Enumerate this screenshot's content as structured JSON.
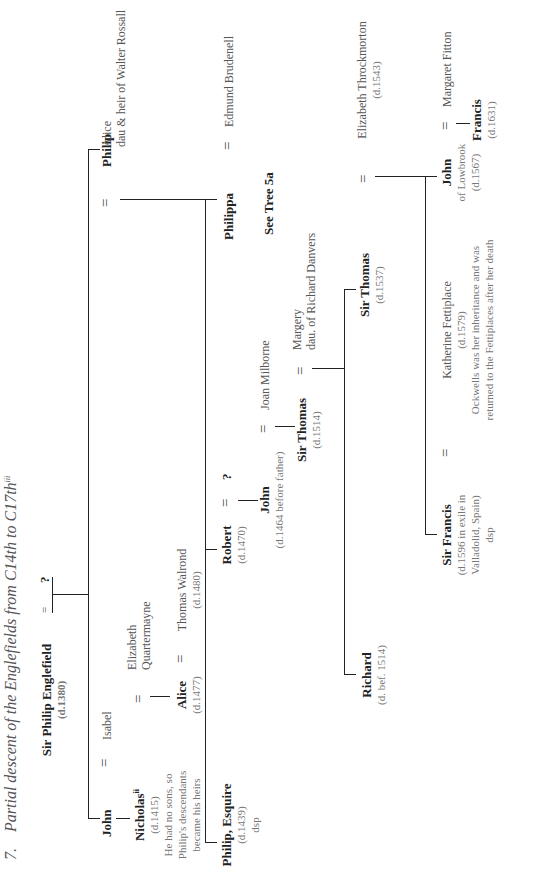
{
  "title": {
    "number": "7.",
    "text": "Partial descent of the Englefields from C14th to C17th",
    "note": "iii"
  },
  "people": {
    "sir_philip": {
      "name": "Sir Philip Englefield",
      "dates": "(d.1380)",
      "spouse": "?"
    },
    "john": {
      "name": "John",
      "spouse": "Isabel"
    },
    "nicholas": {
      "name": "Nicholas",
      "sup": "ii",
      "dates": "(d.1415)",
      "note1": "He had no sons, so",
      "note2": "Philip's descendants",
      "note3": "became his heirs",
      "spouse1": "Elizabeth",
      "spouse2": "Quartermayne"
    },
    "alice": {
      "name": "Alice",
      "dates": "(d.1477)",
      "spouse": "Thomas Walrond",
      "spouse_dates": "(d.1480)"
    },
    "philip": {
      "name": "Philip",
      "spouse": "Alice",
      "spouse_note": "dau & heir of Walter Rossall"
    },
    "philip_esq": {
      "name": "Philip, Esquire",
      "dates": "(d.1439)",
      "note": "dsp"
    },
    "robert": {
      "name": "Robert",
      "dates": "(d.1470)",
      "spouse": "?"
    },
    "john2": {
      "name": "John",
      "dates": "(d.1464 before father)",
      "spouse": "Joan Milborne"
    },
    "philippa": {
      "name": "Philippa",
      "spouse": "Edmund Brudenell",
      "note": "See Tree 5a"
    },
    "sir_thomas1": {
      "name": "Sir Thomas",
      "dates": "(d.1514)",
      "spouse1": "Margery",
      "spouse2": "dau. of Richard Danvers"
    },
    "richard": {
      "name": "Richard",
      "dates": "(d. bef. 1514)"
    },
    "sir_thomas2": {
      "name": "Sir Thomas",
      "dates": "(d.1537)",
      "spouse": "Elizabeth Throckmorton",
      "spouse_dates": "(d.1543)"
    },
    "sir_francis": {
      "name": "Sir Francis",
      "d1": "(d.1596 in exile in",
      "d2": "Valladolid, Spain)",
      "note": "dsp",
      "spouse": "Katherine Fettiplace",
      "spouse_dates": "(d.1579)",
      "n1": "Ockwells was her inheritance and was",
      "n2": "returned to the Fettiplaces after her death"
    },
    "john3": {
      "name": "John",
      "of": "of Lowbrook",
      "dates": "(d.1567)",
      "spouse": "Margaret Fitton"
    },
    "francis": {
      "name": "Francis",
      "dates": "(d.1631)"
    }
  },
  "symbols": {
    "eq": "="
  }
}
